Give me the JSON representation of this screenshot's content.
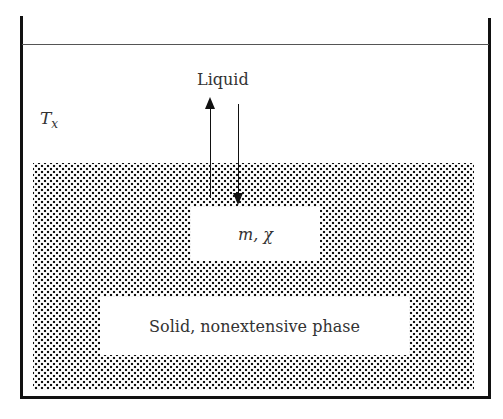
{
  "diagram": {
    "liquid_label": "Liquid",
    "temperature_label": "T",
    "temperature_subscript": "x",
    "inner_label": "m, χ",
    "solid_label": "Solid, nonextensive phase"
  }
}
